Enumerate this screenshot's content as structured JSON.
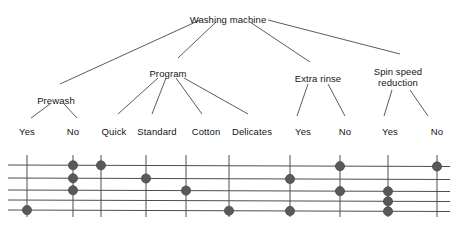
{
  "diagram": {
    "type": "feature-tree-with-dot-matrix",
    "root": {
      "label": "Washing machine",
      "x": 228,
      "y": 14
    },
    "features": [
      {
        "id": "prewash",
        "label": "Prewash",
        "x": 56,
        "y": 95,
        "lines": 1
      },
      {
        "id": "program",
        "label": "Program",
        "x": 168,
        "y": 68,
        "lines": 1
      },
      {
        "id": "rinse",
        "label": "Extra rinse",
        "x": 318,
        "y": 73,
        "lines": 1
      },
      {
        "id": "spin",
        "label": "Spin speed",
        "label2": "reduction",
        "x": 398,
        "y": 66,
        "lines": 2
      }
    ],
    "leaves": [
      {
        "id": "prewash-yes",
        "label": "Yes",
        "x": 27,
        "parent": "prewash"
      },
      {
        "id": "prewash-no",
        "label": "No",
        "x": 73,
        "parent": "prewash"
      },
      {
        "id": "prog-quick",
        "label": "Quick",
        "x": 114,
        "parent": "program"
      },
      {
        "id": "prog-standard",
        "label": "Standard",
        "x": 157,
        "parent": "program"
      },
      {
        "id": "prog-cotton",
        "label": "Cotton",
        "x": 206,
        "parent": "program"
      },
      {
        "id": "prog-delicates",
        "label": "Delicates",
        "x": 252,
        "parent": "program"
      },
      {
        "id": "rinse-yes",
        "label": "Yes",
        "x": 303,
        "parent": "rinse"
      },
      {
        "id": "rinse-no",
        "label": "No",
        "x": 345,
        "parent": "rinse"
      },
      {
        "id": "spin-yes",
        "label": "Yes",
        "x": 390,
        "parent": "spin"
      },
      {
        "id": "spin-no",
        "label": "No",
        "x": 437,
        "parent": "spin"
      }
    ],
    "leaf_label_y": 126,
    "matrix": {
      "columns": [
        "prewash-yes",
        "prewash-no",
        "prog-quick",
        "prog-standard",
        "prog-cotton",
        "prog-delicates",
        "rinse-yes",
        "rinse-no",
        "spin-yes",
        "spin-no"
      ],
      "column_x": [
        27,
        73,
        101,
        146,
        186,
        229,
        290,
        340,
        388,
        437
      ],
      "row_y": [
        165,
        178,
        190,
        200,
        210
      ],
      "grid_left": 8,
      "grid_right": 450,
      "dot_radius": 4.6,
      "dot_color": "#595959",
      "line_color": "#4d4d4d",
      "rows": [
        {
          "row": 1,
          "dots": [
            "prewash-no",
            "prog-quick",
            "rinse-no",
            "spin-no"
          ]
        },
        {
          "row": 2,
          "dots": [
            "prewash-no",
            "prog-standard",
            "rinse-yes"
          ]
        },
        {
          "row": 3,
          "dots": [
            "prewash-no",
            "prog-cotton",
            "rinse-no",
            "spin-yes"
          ]
        },
        {
          "row": 4,
          "dots": [
            "spin-yes"
          ]
        },
        {
          "row": 5,
          "dots": [
            "prewash-yes",
            "prog-delicates",
            "rinse-yes",
            "spin-yes"
          ]
        }
      ]
    },
    "tree_edges": [
      {
        "from": [
          200,
          20
        ],
        "to": [
          60,
          84
        ]
      },
      {
        "from": [
          216,
          22
        ],
        "to": [
          178,
          58
        ]
      },
      {
        "from": [
          250,
          22
        ],
        "to": [
          310,
          62
        ]
      },
      {
        "from": [
          268,
          20
        ],
        "to": [
          400,
          54
        ]
      },
      {
        "from": [
          158,
          78
        ],
        "to": [
          118,
          114
        ]
      },
      {
        "from": [
          166,
          78
        ],
        "to": [
          152,
          114
        ]
      },
      {
        "from": [
          176,
          78
        ],
        "to": [
          202,
          114
        ]
      },
      {
        "from": [
          184,
          78
        ],
        "to": [
          248,
          114
        ]
      },
      {
        "from": [
          50,
          104
        ],
        "to": [
          31,
          118
        ]
      },
      {
        "from": [
          64,
          104
        ],
        "to": [
          77,
          118
        ]
      },
      {
        "from": [
          308,
          84
        ],
        "to": [
          297,
          116
        ]
      },
      {
        "from": [
          328,
          84
        ],
        "to": [
          345,
          116
        ]
      },
      {
        "from": [
          392,
          90
        ],
        "to": [
          384,
          116
        ]
      },
      {
        "from": [
          410,
          90
        ],
        "to": [
          428,
          116
        ]
      }
    ]
  }
}
